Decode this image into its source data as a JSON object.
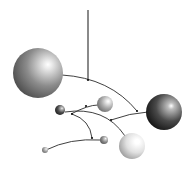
{
  "image": {
    "description": "3D rendered hanging mobile with spheres on curved wires",
    "background": "#ffffff",
    "caption_fragment": ""
  },
  "scene": {
    "wire_color": "#2a2a2a",
    "vertical_string": {
      "x": 88,
      "y1": 10,
      "y2": 80
    },
    "wires": [
      {
        "name": "top-arm",
        "d": "M 62 75 Q 110 78 137 111"
      },
      {
        "name": "right-lower-arm",
        "d": "M 111 120 Q 130 113 148 112"
      },
      {
        "name": "middle-arm-upper",
        "d": "M 71 114 Q 88 105 98 105"
      },
      {
        "name": "middle-arm-long",
        "d": "M 65 112 Q 105 106 125 136"
      },
      {
        "name": "left-arm-down",
        "d": "M 72 114 Q 90 120 92 138"
      },
      {
        "name": "bottom-arm",
        "d": "M 46 150 Q 70 138 100 140"
      }
    ],
    "joints": [
      {
        "x": 88,
        "y": 80
      },
      {
        "x": 137,
        "y": 111
      },
      {
        "x": 111,
        "y": 120
      },
      {
        "x": 72,
        "y": 114
      },
      {
        "x": 86,
        "y": 106
      },
      {
        "x": 92,
        "y": 138
      }
    ],
    "spheres": [
      {
        "name": "large-gray-sphere",
        "cx": 38,
        "cy": 73,
        "r": 25,
        "light": "#e8e8e8",
        "mid": "#8c8c8c",
        "dark": "#4a4a4a"
      },
      {
        "name": "dark-right-sphere",
        "cx": 164,
        "cy": 112,
        "r": 18,
        "light": "#bdbdbd",
        "mid": "#4a4a4a",
        "dark": "#111111"
      },
      {
        "name": "small-light-sphere",
        "cx": 105,
        "cy": 104,
        "r": 8,
        "light": "#f0f0f0",
        "mid": "#a8a8a8",
        "dark": "#6a6a6a"
      },
      {
        "name": "small-dark-sphere",
        "cx": 60,
        "cy": 110,
        "r": 5,
        "light": "#bfbfbf",
        "mid": "#4c4c4c",
        "dark": "#1e1e1e"
      },
      {
        "name": "white-bottom-sphere",
        "cx": 132,
        "cy": 146,
        "r": 13,
        "light": "#ffffff",
        "mid": "#e0e0e0",
        "dark": "#9a9a9a"
      },
      {
        "name": "tiny-mid-sphere",
        "cx": 104,
        "cy": 140,
        "r": 4,
        "light": "#d8d8d8",
        "mid": "#8a8a8a",
        "dark": "#555555"
      },
      {
        "name": "tiny-left-sphere",
        "cx": 45,
        "cy": 150,
        "r": 3,
        "light": "#e0e0e0",
        "mid": "#9c9c9c",
        "dark": "#6c6c6c"
      }
    ]
  }
}
